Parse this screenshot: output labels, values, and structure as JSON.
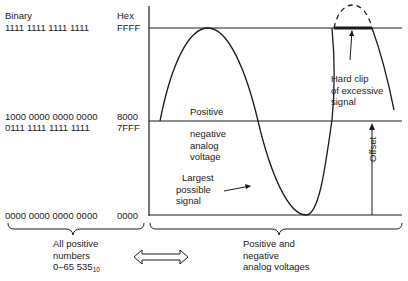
{
  "headers": {
    "binary": "Binary",
    "hex": "Hex"
  },
  "levels": [
    {
      "binary": "1111 1111 1111 1111",
      "hex": "FFFF"
    },
    {
      "binary": "1000 0000 0000 0000",
      "hex": "8000"
    },
    {
      "binary": "0111 1111 1111 1111",
      "hex": "7FFF"
    },
    {
      "binary": "0000 0000 0000 0000",
      "hex": "0000"
    }
  ],
  "annotations": {
    "positive": "Positive",
    "negative": [
      "negative",
      "analog",
      "voltage"
    ],
    "largest": [
      "Largest",
      "possible",
      "signal"
    ],
    "clip": [
      "Hard clip",
      "of excessive",
      "signal"
    ],
    "offset": "Offset"
  },
  "bottom": {
    "left": [
      "All positive",
      "numbers",
      "0–65 535"
    ],
    "left_subscript": "10",
    "right": [
      "Positive and",
      "negative",
      "analog voltages"
    ]
  }
}
